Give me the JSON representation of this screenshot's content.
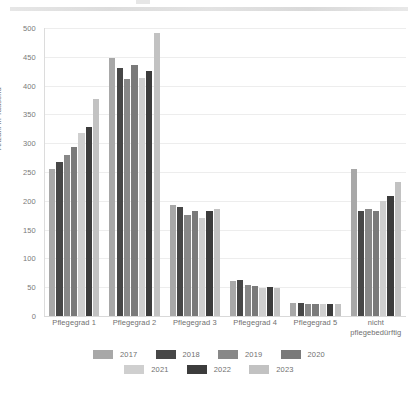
{
  "chart_data": {
    "type": "bar",
    "title": "",
    "subtitle": "",
    "xlabel": "",
    "ylabel": "Anzahl in Tausend",
    "ylim": [
      0,
      500
    ],
    "yticks": [
      0,
      50,
      100,
      150,
      200,
      250,
      300,
      350,
      400,
      450,
      500
    ],
    "grid": true,
    "legend_position": "bottom",
    "categories": [
      "Pflegegrad 1",
      "Pflegegrad 2",
      "Pflegegrad 3",
      "Pflegegrad 4",
      "Pflegegrad 5",
      "nicht\npflegebedürftig"
    ],
    "category_lines": [
      [
        "Pflegegrad 1"
      ],
      [
        "Pflegegrad 2"
      ],
      [
        "Pflegegrad 3"
      ],
      [
        "Pflegegrad 4"
      ],
      [
        "Pflegegrad 5"
      ],
      [
        "nicht",
        "pflegebedürftig"
      ]
    ],
    "series": [
      {
        "name": "2017",
        "color": "#a8a8a8",
        "values": [
          256,
          448,
          192,
          60,
          22,
          255
        ]
      },
      {
        "name": "2018",
        "color": "#474747",
        "values": [
          267,
          431,
          190,
          62,
          23,
          182
        ]
      },
      {
        "name": "2019",
        "color": "#888888",
        "values": [
          280,
          411,
          175,
          54,
          21,
          185
        ]
      },
      {
        "name": "2020",
        "color": "#7a7a7a",
        "values": [
          293,
          436,
          183,
          52,
          21,
          182
        ]
      },
      {
        "name": "2021",
        "color": "#cfcfcf",
        "values": [
          317,
          414,
          170,
          49,
          20,
          199
        ]
      },
      {
        "name": "2022",
        "color": "#3c3c3c",
        "values": [
          328,
          425,
          182,
          51,
          20,
          209
        ]
      },
      {
        "name": "2023",
        "color": "#c2c2c2",
        "values": [
          376,
          491,
          186,
          49,
          20,
          232
        ]
      }
    ]
  },
  "axis": {
    "y_title": "Anzahl in Tausend"
  }
}
